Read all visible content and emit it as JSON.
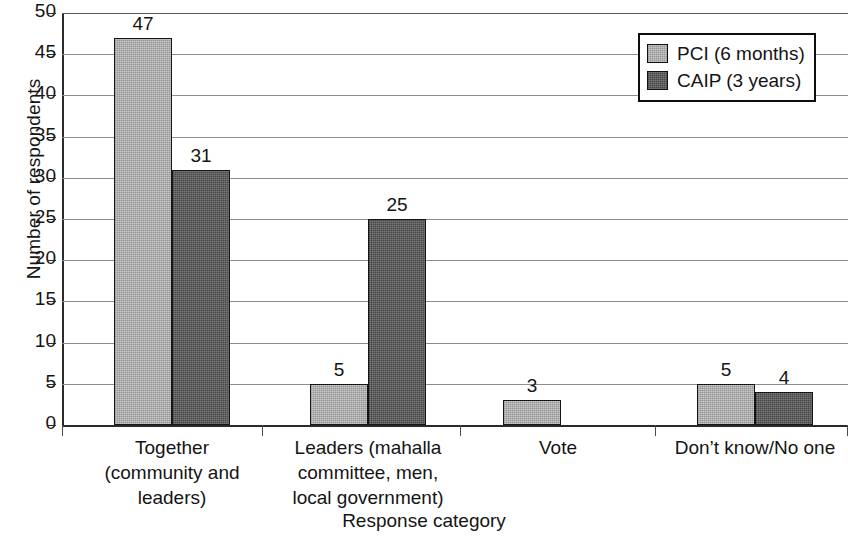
{
  "chart_data": {
    "type": "bar",
    "title": "",
    "xlabel": "Response category",
    "ylabel": "Number of respondents",
    "ylim": [
      0,
      50
    ],
    "ytick_labels": [
      "50",
      "45",
      "40",
      "35",
      "30",
      "25",
      "20",
      "15",
      "10",
      "5",
      "0"
    ],
    "ytick_values": [
      50,
      45,
      40,
      35,
      30,
      25,
      20,
      15,
      10,
      5,
      0
    ],
    "grid": true,
    "grid_axis": "y",
    "legend_position": "top-right",
    "categories": [
      "Together\n(community and\nleaders)",
      "Leaders (mahalla\ncommittee, men,\nlocal government)",
      "Vote",
      "Don’t know/No one"
    ],
    "category_lines": [
      [
        "Together",
        "(community and",
        "leaders)"
      ],
      [
        "Leaders (mahalla",
        "committee, men,",
        "local government)"
      ],
      [
        "Vote"
      ],
      [
        "Don’t know/No one"
      ]
    ],
    "series": [
      {
        "name": "PCI (6 months)",
        "color": "#a5a5a5",
        "values": [
          47,
          5,
          3,
          5
        ],
        "labels": [
          "47",
          "5",
          "3",
          "5"
        ]
      },
      {
        "name": "CAIP (3 years)",
        "color": "#555555",
        "values": [
          31,
          25,
          null,
          4
        ],
        "labels": [
          "31",
          "25",
          "",
          "4"
        ]
      }
    ]
  },
  "legend": {
    "items": [
      {
        "label": "PCI (6 months)",
        "swatch": "series-pci"
      },
      {
        "label": "CAIP (3 years)",
        "swatch": "series-caip"
      }
    ]
  },
  "axes": {
    "y_title": "Number of respondents",
    "x_title": "Response category"
  }
}
